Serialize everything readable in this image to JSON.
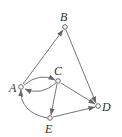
{
  "diagram": {
    "type": "directed-graph",
    "nodes": [
      {
        "id": "A",
        "label": "A",
        "x": 21,
        "y": 87
      },
      {
        "id": "B",
        "label": "B",
        "x": 65,
        "y": 27
      },
      {
        "id": "C",
        "label": "C",
        "x": 58,
        "y": 81
      },
      {
        "id": "D",
        "label": "D",
        "x": 98,
        "y": 106
      },
      {
        "id": "E",
        "label": "E",
        "x": 50,
        "y": 118
      }
    ],
    "edges": [
      {
        "from": "A",
        "to": "B"
      },
      {
        "from": "B",
        "to": "D"
      },
      {
        "from": "A",
        "to": "C",
        "curve": "upper"
      },
      {
        "from": "C",
        "to": "A",
        "curve": "lower"
      },
      {
        "from": "C",
        "to": "D"
      },
      {
        "from": "C",
        "to": "E"
      },
      {
        "from": "E",
        "to": "D"
      },
      {
        "from": "E",
        "to": "A",
        "curve": "left"
      }
    ]
  }
}
